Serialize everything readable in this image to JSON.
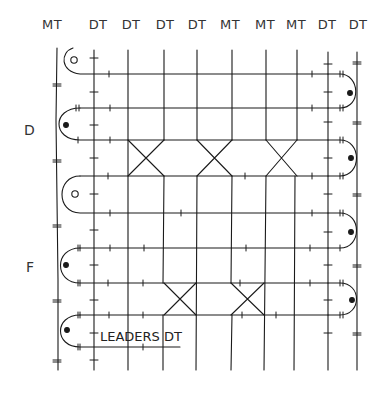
{
  "diagram": {
    "type": "weaving-draft",
    "ink_color": "#1a1a1a",
    "columns": [
      {
        "label": "MT",
        "x": 52,
        "line_x": 57
      },
      {
        "label": "DT",
        "x": 98,
        "line_x": 94
      },
      {
        "label": "DT",
        "x": 131,
        "line_x": 128
      },
      {
        "label": "DT",
        "x": 165,
        "line_x": 164
      },
      {
        "label": "DT",
        "x": 197,
        "line_x": 197
      },
      {
        "label": "MT",
        "x": 230,
        "line_x": 232
      },
      {
        "label": "MT",
        "x": 265,
        "line_x": 266
      },
      {
        "label": "MT",
        "x": 296,
        "line_x": 297
      },
      {
        "label": "DT",
        "x": 327,
        "line_x": 328
      },
      {
        "label": "DT",
        "x": 358,
        "line_x": 357
      }
    ],
    "side_labels": [
      {
        "text": "D",
        "y": 123
      },
      {
        "text": "F",
        "y": 260
      }
    ],
    "annotation": {
      "text": "LEADERS DT"
    }
  }
}
